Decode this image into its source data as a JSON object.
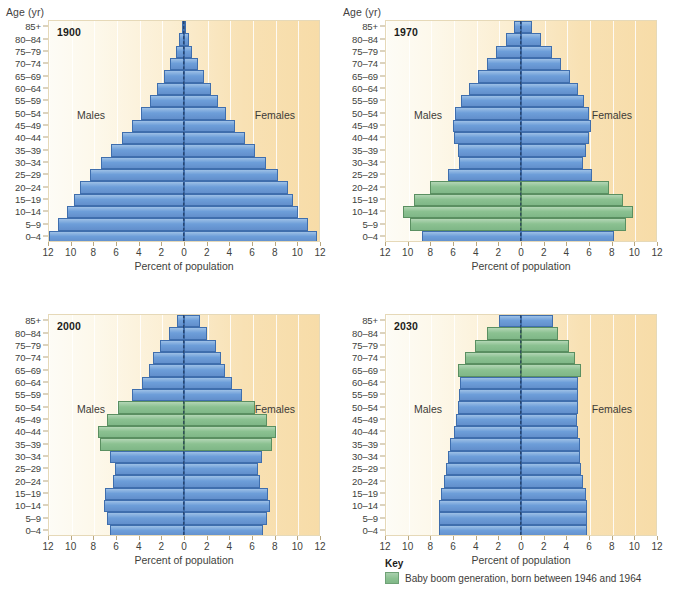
{
  "figure": {
    "age_axis_title": "Age (yr)",
    "x_axis_title": "Percent of population",
    "males_label": "Males",
    "females_label": "Females"
  },
  "key": {
    "title": "Key",
    "swatch_color": "#8bc191",
    "label": "Baby boom generation, born between 1946 and 1964"
  },
  "colors": {
    "bar_blue": "#6d9ed9",
    "bar_blue_border": "#3f6ead",
    "bar_green": "#8bc191",
    "bar_green_border": "#5a8f61",
    "plot_background_left": "#fdfcf6",
    "plot_background_right": "#f7dca8",
    "zero_line": "#1f3556"
  },
  "chart_data": {
    "type": "bar",
    "subtype": "population-pyramid",
    "xlabel": "Percent of population",
    "ylabel": "Age (yr)",
    "xlim": [
      -12,
      12
    ],
    "xticks": [
      12,
      10,
      8,
      6,
      4,
      2,
      0,
      2,
      4,
      6,
      8,
      10,
      12
    ],
    "xtick_values": [
      -12,
      -10,
      -8,
      -6,
      -4,
      -2,
      0,
      2,
      4,
      6,
      8,
      10,
      12
    ],
    "grid": true,
    "legend": {
      "position": "bottom-right",
      "entries": [
        "Baby boom generation, born between 1946 and 1964"
      ]
    },
    "categories": [
      "0–4",
      "5–9",
      "10–14",
      "15–19",
      "20–24",
      "25–29",
      "30–34",
      "35–39",
      "40–44",
      "45–49",
      "50–54",
      "55–59",
      "60–64",
      "65–69",
      "70–74",
      "75–79",
      "80–84",
      "85+"
    ],
    "panels": [
      {
        "year": "1900",
        "males": [
          11.9,
          11.1,
          10.3,
          9.7,
          9.2,
          8.3,
          7.3,
          6.4,
          5.5,
          4.6,
          3.8,
          3.0,
          2.4,
          1.8,
          1.2,
          0.7,
          0.4,
          0.2
        ],
        "females": [
          11.7,
          10.9,
          10.1,
          9.6,
          9.2,
          8.3,
          7.2,
          6.3,
          5.4,
          4.5,
          3.7,
          3.0,
          2.4,
          1.8,
          1.2,
          0.7,
          0.4,
          0.2
        ],
        "baby_boom_categories": []
      },
      {
        "year": "1970",
        "males": [
          8.7,
          9.8,
          10.4,
          9.4,
          8.0,
          6.4,
          5.5,
          5.6,
          5.9,
          6.0,
          5.8,
          5.3,
          4.6,
          3.8,
          3.0,
          2.2,
          1.3,
          0.6
        ],
        "females": [
          8.2,
          9.3,
          9.9,
          9.0,
          7.8,
          6.3,
          5.5,
          5.7,
          6.0,
          6.2,
          6.0,
          5.6,
          5.0,
          4.3,
          3.5,
          2.7,
          1.8,
          1.0
        ],
        "baby_boom_categories": [
          "5–9",
          "10–14",
          "15–19",
          "20–24"
        ]
      },
      {
        "year": "2000",
        "males": [
          6.5,
          6.8,
          7.1,
          7.0,
          6.3,
          6.1,
          6.5,
          7.4,
          7.6,
          6.8,
          5.8,
          4.6,
          3.7,
          3.1,
          2.7,
          2.1,
          1.3,
          0.6
        ],
        "females": [
          7.0,
          7.3,
          7.6,
          7.4,
          6.7,
          6.5,
          6.9,
          7.8,
          8.1,
          7.3,
          6.3,
          5.1,
          4.2,
          3.6,
          3.3,
          2.8,
          2.0,
          1.4
        ],
        "baby_boom_categories": [
          "35–39",
          "40–44",
          "45–49",
          "50–54"
        ]
      },
      {
        "year": "2030",
        "males": [
          7.2,
          7.2,
          7.2,
          7.1,
          6.8,
          6.6,
          6.4,
          6.3,
          5.9,
          5.7,
          5.6,
          5.5,
          5.4,
          5.6,
          4.9,
          4.1,
          3.0,
          1.9
        ],
        "females": [
          5.8,
          5.8,
          5.8,
          5.7,
          5.5,
          5.3,
          5.2,
          5.2,
          5.0,
          4.9,
          5.0,
          5.0,
          5.0,
          5.3,
          4.8,
          4.2,
          3.3,
          2.8
        ],
        "baby_boom_categories": [
          "65–69",
          "70–74",
          "75–79",
          "80–84"
        ]
      }
    ]
  }
}
